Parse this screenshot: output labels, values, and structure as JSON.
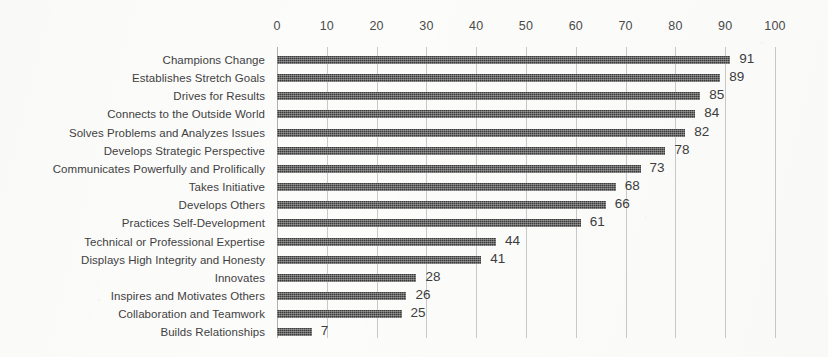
{
  "chart_data": {
    "type": "bar",
    "orientation": "horizontal",
    "title": "",
    "subtitle": "",
    "xlabel": "",
    "ylabel": "",
    "xlim": [
      0,
      100
    ],
    "xticks": [
      0,
      10,
      20,
      30,
      40,
      50,
      60,
      70,
      80,
      90,
      100
    ],
    "xtick_labels": [
      "0",
      "10",
      "20",
      "30",
      "40",
      "50",
      "60",
      "70",
      "80",
      "90",
      "100"
    ],
    "grid": "vertical",
    "legend": "none",
    "axis_position": "top",
    "bar_color": "#3b3b3b",
    "gridline_color": "#c9c9c9",
    "background_color": "#fcfcfb",
    "label_color": "#3f3f3f",
    "value_labels_shown": true,
    "categories": [
      "Champions Change",
      "Establishes Stretch Goals",
      "Drives for Results",
      "Connects to the Outside World",
      "Solves Problems and Analyzes Issues",
      "Develops Strategic Perspective",
      "Communicates Powerfully and Prolifically",
      "Takes Initiative",
      "Develops Others",
      "Practices Self-Development",
      "Technical or Professional Expertise",
      "Displays High Integrity and Honesty",
      "Innovates",
      "Inspires and Motivates Others",
      "Collaboration and Teamwork",
      "Builds Relationships"
    ],
    "values": [
      91,
      89,
      85,
      84,
      82,
      78,
      73,
      68,
      66,
      61,
      44,
      41,
      28,
      26,
      25,
      7
    ],
    "value_label_texts": [
      "91",
      "89",
      "85",
      "84",
      "82",
      "78",
      "73",
      "68",
      "66",
      "61",
      "44",
      "41",
      "28",
      "26",
      "25",
      "7"
    ]
  }
}
